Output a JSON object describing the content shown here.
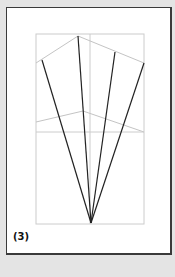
{
  "figure": {
    "label": "(3)",
    "colors": {
      "background": "#e4e4e4",
      "card": "#ffffff",
      "guide_lines": "#c8c8c8",
      "rays": "#222222"
    },
    "guide_rect": {
      "x1": 36,
      "y1": 34,
      "x2": 144,
      "y2": 224
    },
    "center_line_x": 90,
    "upper_polyline": [
      [
        36,
        63
      ],
      [
        78,
        36
      ],
      [
        144,
        63
      ]
    ],
    "lower_polyline": [
      [
        36,
        122
      ],
      [
        83,
        111
      ],
      [
        144,
        132
      ]
    ],
    "horizontal_guide_y": 132,
    "apex": [
      91,
      223
    ],
    "ray_endpoints": [
      [
        42,
        60
      ],
      [
        78,
        36
      ],
      [
        115,
        52
      ],
      [
        144,
        63
      ]
    ]
  }
}
